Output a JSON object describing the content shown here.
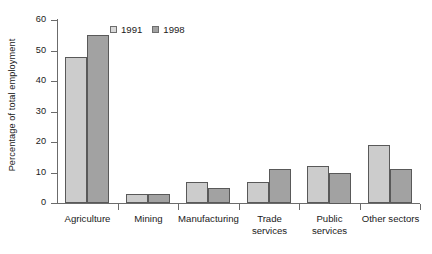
{
  "chart_data": {
    "type": "bar",
    "title": "",
    "xlabel": "",
    "ylabel": "Percentage of total employment",
    "ylim": [
      0,
      60
    ],
    "y_ticks": [
      0,
      10,
      20,
      30,
      40,
      50,
      60
    ],
    "grid": false,
    "legend_position": "top-left-inside",
    "categories": [
      "Agriculture",
      "Mining",
      "Manufacturing",
      "Trade\nservices",
      "Public\nservices",
      "Other sectors"
    ],
    "series": [
      {
        "name": "1991",
        "color": "#cccccc",
        "values": [
          48,
          3,
          7,
          7,
          12,
          19
        ]
      },
      {
        "name": "1998",
        "color": "#a2a2a2",
        "values": [
          55,
          3,
          5,
          11,
          10,
          11
        ]
      }
    ]
  },
  "legend": {
    "items": [
      {
        "label": "1991",
        "swatch": "legend-swatch-1991"
      },
      {
        "label": "1998",
        "swatch": "legend-swatch-1998"
      }
    ]
  },
  "axes": {
    "y_title": "Percentage of total employment",
    "y_tick_labels": [
      "60",
      "50",
      "40",
      "30",
      "20",
      "10",
      "0"
    ],
    "x_tick_labels": [
      "Agriculture",
      "Mining",
      "Manufacturing",
      "Trade\nservices",
      "Public\nservices",
      "Other sectors"
    ]
  }
}
